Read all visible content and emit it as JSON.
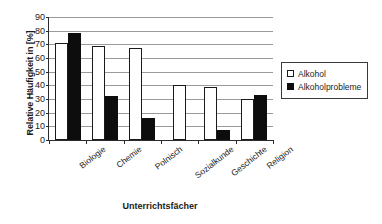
{
  "chart_data": {
    "type": "bar",
    "title": "",
    "xlabel": "Unterrichtsfächer",
    "ylabel": "Relative Häufigkeit in [%]",
    "categories": [
      "Biologie",
      "Chemie",
      "Polnisch",
      "Sozialkunde",
      "Geschichte",
      "Religion"
    ],
    "series": [
      {
        "name": "Alkohol",
        "values": [
          71,
          69,
          67,
          40.5,
          39,
          30
        ],
        "color": "#ffffff"
      },
      {
        "name": "Alkoholprobleme",
        "values": [
          78,
          32,
          16,
          0,
          7,
          33
        ],
        "color": "#0d0d0d"
      }
    ],
    "ylim": [
      0,
      90
    ],
    "ytick_step": 10,
    "yticks": [
      90,
      80,
      70,
      60,
      50,
      40,
      30,
      20,
      10,
      0
    ],
    "grid": true,
    "legend_position": "right"
  },
  "legend": {
    "items": [
      {
        "label": "Alkohol",
        "marker": "white-square"
      },
      {
        "label": "Alkoholprobleme",
        "marker": "black-square"
      }
    ]
  }
}
